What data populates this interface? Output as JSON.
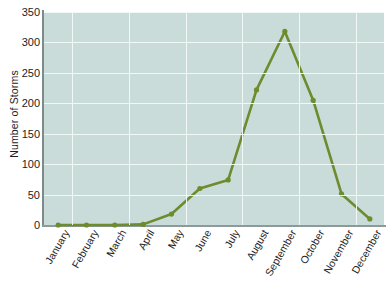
{
  "chart_data": {
    "type": "line",
    "title": "",
    "xlabel": "",
    "ylabel": "Number of Storms",
    "categories": [
      "January",
      "February",
      "March",
      "April",
      "May",
      "June",
      "July",
      "August",
      "September",
      "October",
      "November",
      "December"
    ],
    "values": [
      0,
      0,
      0,
      1,
      18,
      60,
      74,
      222,
      318,
      205,
      51,
      10
    ],
    "series": [
      {
        "name": "Number of Storms",
        "values": [
          0,
          0,
          0,
          1,
          18,
          60,
          74,
          222,
          318,
          205,
          51,
          10
        ]
      }
    ],
    "ylim": [
      0,
      350
    ],
    "yticks": [
      0,
      50,
      100,
      150,
      200,
      250,
      300,
      350
    ],
    "ytick_labels": [
      "0",
      "50",
      "100",
      "150",
      "200",
      "250",
      "300",
      "350"
    ],
    "grid": true,
    "legend": "none",
    "line_color": "#6e8b2e",
    "marker_color": "#6e8b2e",
    "plot_background": "#c9dcda",
    "gridline_color": "#f4fbfa",
    "axis_color": "#8c9a9a",
    "text_color": "#1d1d1d"
  }
}
